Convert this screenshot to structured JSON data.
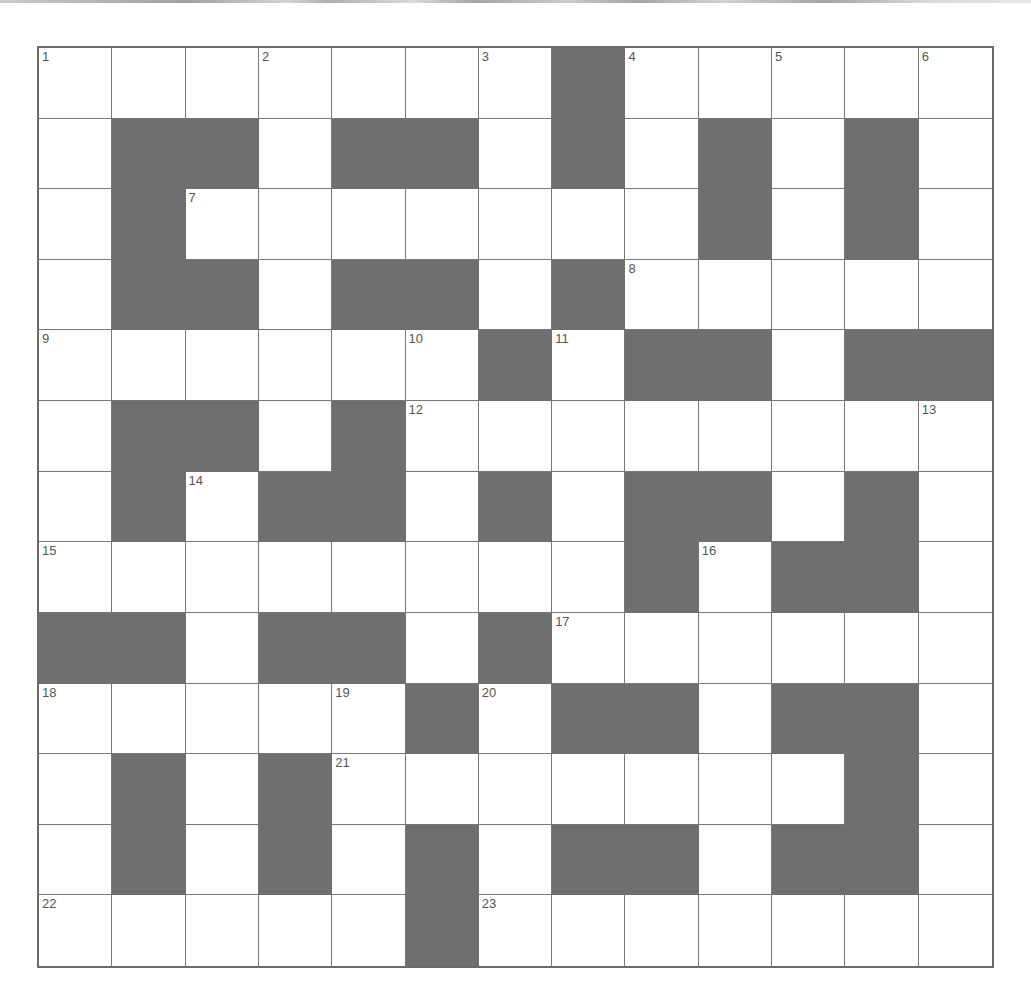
{
  "puzzle": {
    "rows": 13,
    "cols": 13,
    "colors": {
      "block": "#6f6f6f",
      "cell": "#ffffff",
      "line": "#777777"
    },
    "layout": [
      "WWWWWWWBWWWWW",
      "WBBWBBWBWBWBW",
      "WBWWWWWWWBWBW",
      "WBBWBBWBWWWWW",
      "WWWWWWBWBBWBB",
      "WBBWBWWWWWWWW",
      "WBWBBWBWBBWBW",
      "WWWWWWWWBWBBW",
      "BBWBBWBWWWWWW",
      "WWWWWBWBBWBBW",
      "WBWBWWWWWWWBW",
      "WBWBWBWBBWBBW",
      "WWWWWBWWWWWWW"
    ],
    "numbers": [
      {
        "r": 0,
        "c": 0,
        "n": "1"
      },
      {
        "r": 0,
        "c": 3,
        "n": "2"
      },
      {
        "r": 0,
        "c": 6,
        "n": "3"
      },
      {
        "r": 0,
        "c": 8,
        "n": "4"
      },
      {
        "r": 0,
        "c": 10,
        "n": "5"
      },
      {
        "r": 0,
        "c": 12,
        "n": "6"
      },
      {
        "r": 2,
        "c": 2,
        "n": "7"
      },
      {
        "r": 3,
        "c": 8,
        "n": "8"
      },
      {
        "r": 4,
        "c": 0,
        "n": "9"
      },
      {
        "r": 4,
        "c": 5,
        "n": "10"
      },
      {
        "r": 4,
        "c": 7,
        "n": "11"
      },
      {
        "r": 5,
        "c": 5,
        "n": "12"
      },
      {
        "r": 5,
        "c": 12,
        "n": "13"
      },
      {
        "r": 6,
        "c": 2,
        "n": "14"
      },
      {
        "r": 7,
        "c": 0,
        "n": "15"
      },
      {
        "r": 7,
        "c": 9,
        "n": "16"
      },
      {
        "r": 8,
        "c": 7,
        "n": "17"
      },
      {
        "r": 9,
        "c": 0,
        "n": "18"
      },
      {
        "r": 9,
        "c": 4,
        "n": "19"
      },
      {
        "r": 9,
        "c": 6,
        "n": "20"
      },
      {
        "r": 10,
        "c": 4,
        "n": "21"
      },
      {
        "r": 12,
        "c": 0,
        "n": "22"
      },
      {
        "r": 12,
        "c": 6,
        "n": "23"
      }
    ]
  }
}
